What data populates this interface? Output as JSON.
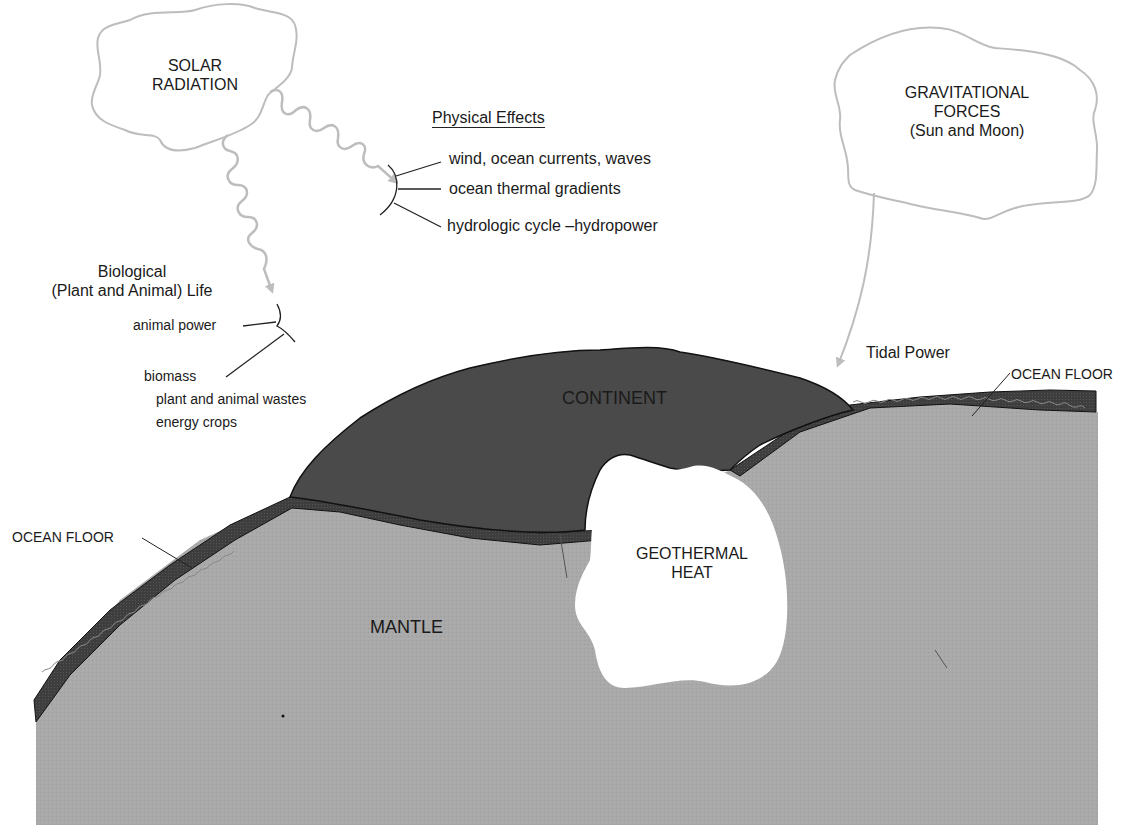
{
  "diagram": {
    "colors": {
      "background": "#ffffff",
      "cloud_outline": "#bdbdbd",
      "wavy_arrow": "#bdbdbd",
      "continent": "#4a4a4a",
      "ocean_floor": "#3c3c3c",
      "mantle": "#a9a9a9",
      "geothermal": "#ffffff",
      "text": "#1a1a1a"
    },
    "sources": {
      "solar": {
        "line1": "SOLAR",
        "line2": "RADIATION"
      },
      "gravitational": {
        "line1": "GRAVITATIONAL",
        "line2": "FORCES",
        "line3": "(Sun and Moon)"
      }
    },
    "physical_effects": {
      "heading": "Physical Effects",
      "items": [
        "wind, ocean currents, waves",
        "ocean thermal gradients",
        "hydrologic cycle  –hydropower"
      ]
    },
    "biological": {
      "heading_line1": "Biological",
      "heading_line2": "(Plant and Animal) Life",
      "items": {
        "animal_power": "animal power",
        "biomass": "biomass",
        "biomass_sub1": "plant and animal wastes",
        "biomass_sub2": "energy crops"
      }
    },
    "tidal": {
      "label": "Tidal Power"
    },
    "earth_layers": {
      "continent": "CONTINENT",
      "ocean_floor_right": "OCEAN FLOOR",
      "ocean_floor_left": "OCEAN FLOOR",
      "mantle": "MANTLE",
      "geothermal_line1": "GEOTHERMAL",
      "geothermal_line2": "HEAT"
    }
  }
}
